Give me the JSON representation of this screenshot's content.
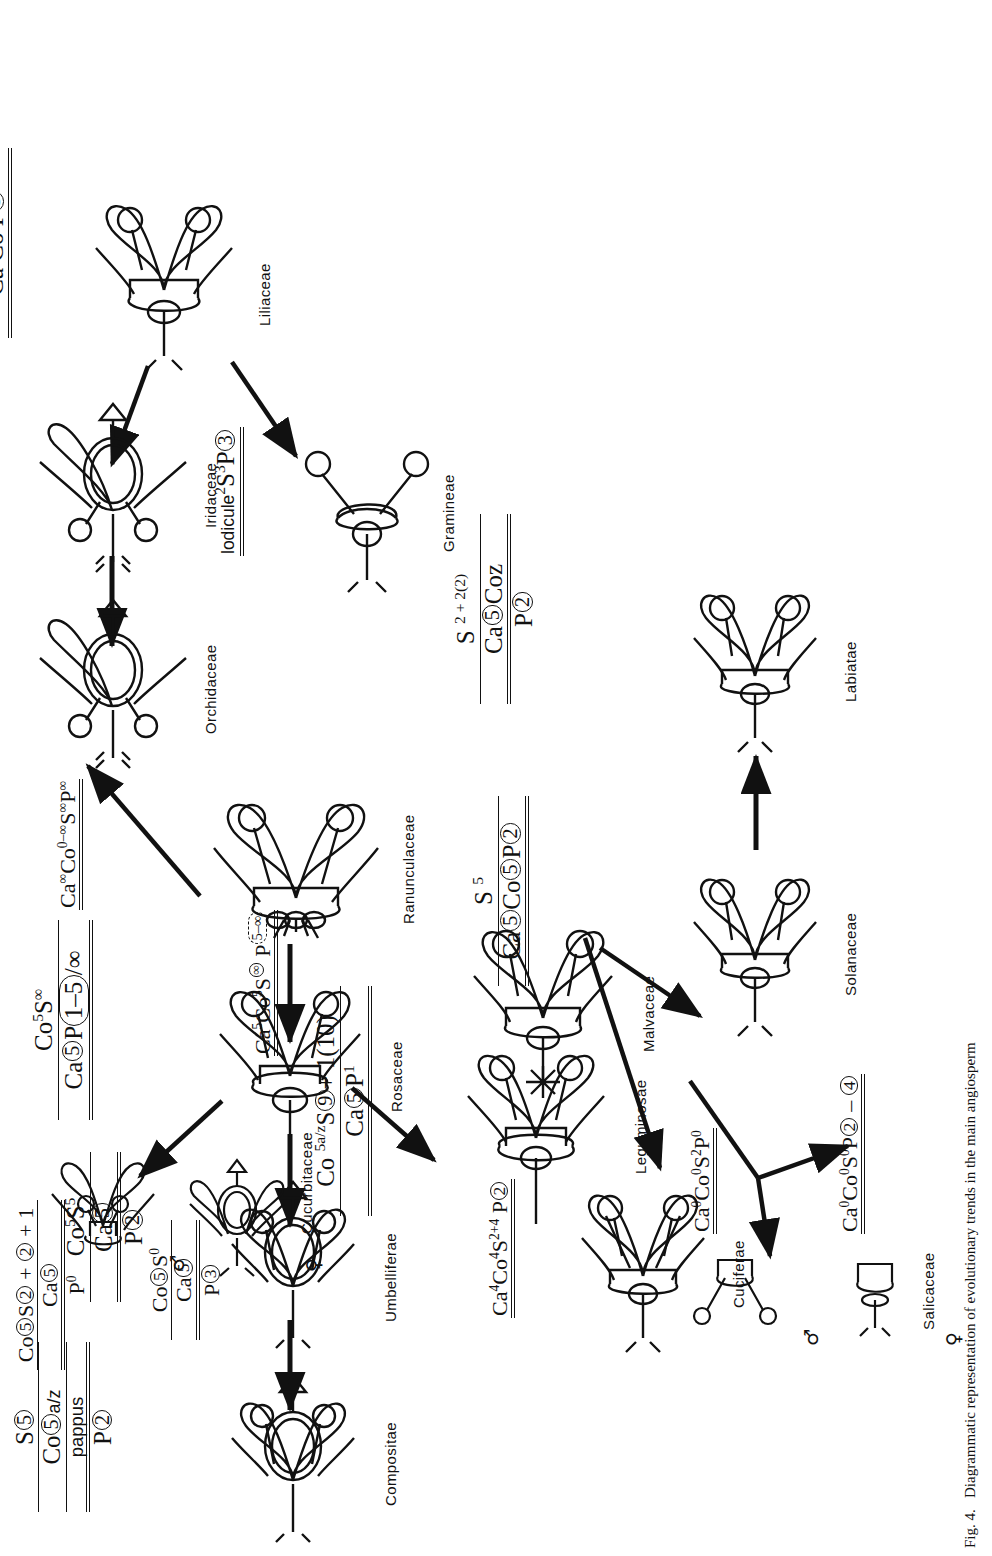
{
  "figure": {
    "caption_prefix": "Fig. 4.",
    "caption_text": "Diagrammatic representation of evolutionary trends in the main angiosperm"
  },
  "families": [
    {
      "id": "labiatae",
      "label": "Labiatae",
      "diagram": "zygomorphic-half-inferior",
      "formula": {
        "line1": "S 2 + 2(2)",
        "line2": "Ca⓪ Coz",
        "line3": "P②"
      }
    },
    {
      "id": "solanaceae",
      "label": "Solanaceae",
      "diagram": "actinomorphic-superior",
      "formula": {
        "line1": "S 5",
        "line2": "Ca⓪ Co⓪ P②"
      }
    },
    {
      "id": "salicaceae",
      "label": "Salicaceae",
      "diagram": "unisexual-pair",
      "male_symbol": "♂",
      "female_symbol": "♀",
      "formula_male": "Ca0 Co0 S2 P0",
      "formula_female": "Ca0 Co0 S0 P② – ④"
    },
    {
      "id": "malvaceae",
      "label": "Malvaceae",
      "diagram": "actinomorphic-many-stamens",
      "formula": "Ca5 Co5 S(∞) P(5–∞)"
    },
    {
      "id": "cuciferae",
      "label": "Cuciferae",
      "diagram": "actinomorphic-superior",
      "formula": "Ca4 Co4 S2+4 P②"
    },
    {
      "id": "compositae",
      "label": "Compositae",
      "diagram": "inferior-ovary",
      "formula": {
        "line1": "S⓪",
        "line2": "Co⓪ a/z",
        "line3": "pappus",
        "line4": "P②"
      }
    },
    {
      "id": "umbelliferae",
      "label": "Umbelliferae",
      "diagram": "inferior-ovary",
      "formula": {
        "line1": "Co5 S5",
        "line2": "Ca⓪",
        "line3": "P②"
      }
    },
    {
      "id": "rosaceae",
      "label": "Rosaceae",
      "diagram": "perigynous-many-stamens",
      "formula": {
        "line1": "Co5 S∞",
        "line2": "Ca⓪ P(1–5)/∞"
      }
    },
    {
      "id": "ranunculaceae",
      "label": "Ranunculaceae",
      "diagram": "hypogynous-many-parts",
      "formula": "Ca∞ Co0–∞ S∞ P∞"
    },
    {
      "id": "cucurbitaceae",
      "label": "Cucurbitaceae",
      "diagram": "unisexual-pair",
      "male_symbol": "♂",
      "female_symbol": "♀",
      "formula_male": {
        "line1": "Co⓪ S② + ② + 1",
        "line2": "Ca⓪",
        "line3": "P0"
      },
      "formula_female": {
        "line1": "Co⓪ S0",
        "line2": "Ca⓪",
        "line3": "P③"
      }
    },
    {
      "id": "leguminosae",
      "label": "Leguminosae",
      "diagram": "zygomorphic-superior",
      "formula": {
        "line1": "Co 5a/z S⑨ + 1(10)",
        "line2": "Ca⓪ P1"
      }
    },
    {
      "id": "orchidaceae",
      "label": "Orchidaceae",
      "diagram": "inferior-ovary-zygo",
      "formula": {
        "line1": "S1 – 2",
        "line2": "③ + 3",
        "line3": "Ca Coz",
        "line4": "P③"
      }
    },
    {
      "id": "iridaceae",
      "label": "Iridaceae",
      "diagram": "inferior-ovary",
      "formula": {
        "line1": "S3",
        "line2": "③ + 3",
        "line3": "Ca Co",
        "line4": "P③"
      }
    },
    {
      "id": "liliaceae",
      "label": "Liliaceae",
      "diagram": "actinomorphic-superior",
      "formula": {
        "line1": "S 6(3)",
        "line2": "③ + 3",
        "line3": "Ca Co P③"
      }
    },
    {
      "id": "gramineae",
      "label": "Gramineae",
      "diagram": "reduced-grass",
      "formula": "lodicule2 S3 P③"
    }
  ],
  "arrows": [
    {
      "from": "solanaceae",
      "to": "labiatae"
    },
    {
      "from": "malvaceae",
      "to": "solanaceae"
    },
    {
      "from": "malvaceae",
      "to": "salicaceae"
    },
    {
      "from": "ranunculaceae",
      "to": "malvaceae"
    },
    {
      "from": "ranunculaceae",
      "to": "cuciferae"
    },
    {
      "from": "ranunculaceae",
      "to": "rosaceae"
    },
    {
      "from": "ranunculaceae",
      "to": "liliaceae"
    },
    {
      "from": "rosaceae",
      "to": "umbelliferae"
    },
    {
      "from": "umbelliferae",
      "to": "compositae"
    },
    {
      "from": "rosaceae",
      "to": "cucurbitaceae"
    },
    {
      "from": "rosaceae",
      "to": "leguminosae"
    },
    {
      "from": "liliaceae",
      "to": "iridaceae"
    },
    {
      "from": "liliaceae",
      "to": "gramineae"
    },
    {
      "from": "iridaceae",
      "to": "orchidaceae"
    }
  ]
}
